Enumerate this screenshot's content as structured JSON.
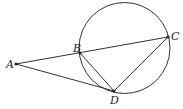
{
  "diagram": {
    "type": "geometry",
    "circle": {
      "cx": 124.5,
      "cy": 48,
      "r": 45.5
    },
    "points": {
      "A": {
        "label": "A",
        "x": 16,
        "y": 64
      },
      "B": {
        "label": "B",
        "x": 80,
        "y": 53
      },
      "C": {
        "label": "C",
        "x": 168,
        "y": 37
      },
      "D": {
        "label": "D",
        "x": 114,
        "y": 91
      }
    },
    "segments": [
      "AC",
      "AD",
      "BD",
      "CD"
    ],
    "colors": {
      "stroke": "#333333",
      "background": "#ffffff"
    }
  }
}
